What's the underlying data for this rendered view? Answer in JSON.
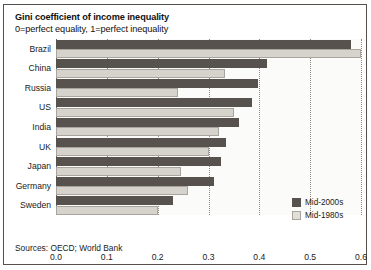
{
  "figure": {
    "title": "Gini coefficient of income inequality",
    "subtitle": "0=perfect equality, 1=perfect inequality",
    "source": "Sources: OECD; World Bank",
    "colors": {
      "series_mid_2000s": "#57524d",
      "series_mid_1980s": "#d6d3cd",
      "border": "#55504b",
      "plot_background": "#fbfbfa",
      "gridline": "#8d8880"
    }
  },
  "legend": {
    "position": "bottom-right",
    "items": [
      {
        "label": "Mid-2000s",
        "swatch": "dark"
      },
      {
        "label": "Mid-1980s",
        "swatch": "light"
      }
    ]
  },
  "chart_data": {
    "type": "bar",
    "orientation": "horizontal",
    "title": "Gini coefficient of income inequality",
    "subtitle": "0=perfect equality, 1=perfect inequality",
    "xlabel": "",
    "ylabel": "",
    "xlim": [
      0.0,
      0.6
    ],
    "xticks": [
      0.0,
      0.1,
      0.2,
      0.3,
      0.4,
      0.5,
      0.6
    ],
    "xtick_labels": [
      "0.0",
      "0.1",
      "0.2",
      "0.3",
      "0.4",
      "0.5",
      "0.6"
    ],
    "grid": true,
    "grid_axis": "x",
    "grid_style": "dotted",
    "categories": [
      "Brazil",
      "China",
      "Russia",
      "US",
      "India",
      "UK",
      "Japan",
      "Germany",
      "Sweden"
    ],
    "series": [
      {
        "name": "Mid-2000s",
        "color": "#57524d",
        "values": [
          0.58,
          0.415,
          0.398,
          0.385,
          0.36,
          0.335,
          0.325,
          0.31,
          0.23
        ]
      },
      {
        "name": "Mid-1980s",
        "color": "#d6d3cd",
        "values": [
          0.6,
          0.332,
          0.24,
          0.35,
          0.32,
          0.3,
          0.245,
          0.26,
          0.2
        ]
      }
    ],
    "source": "Sources: OECD; World Bank"
  }
}
